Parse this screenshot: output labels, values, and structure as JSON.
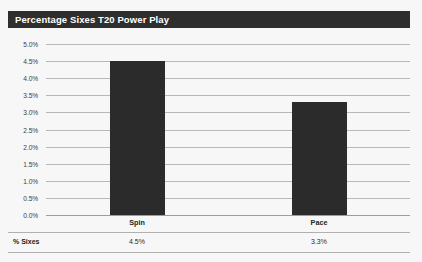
{
  "chart_data": {
    "type": "bar",
    "title": "Percentage Sixes T20 Power Play",
    "categories": [
      "Spin",
      "Pace"
    ],
    "values": [
      4.5,
      3.3
    ],
    "value_labels": [
      "4.5%",
      "3.3%"
    ],
    "series": [
      {
        "name": "% Sixes",
        "values": [
          4.5,
          3.3
        ]
      }
    ],
    "xlabel": "",
    "ylabel": "",
    "ylim": [
      0.0,
      5.0
    ],
    "ytick_labels": [
      "0.0%",
      "0.5%",
      "1.0%",
      "1.5%",
      "2.0%",
      "2.5%",
      "3.0%",
      "3.5%",
      "4.0%",
      "4.5%",
      "5.0%"
    ],
    "ytick_values": [
      0.0,
      0.5,
      1.0,
      1.5,
      2.0,
      2.5,
      3.0,
      3.5,
      4.0,
      4.5,
      5.0
    ],
    "grid": true,
    "legend": false,
    "data_table_visible": true,
    "bar_color": "#2b2b2b",
    "title_bar_color": "#2e2e2e",
    "title_text_color": "#ffffff",
    "gridline_color": "#b8b8b8",
    "plot_background": "#f7f7f7"
  },
  "data_table": {
    "row_label": "% Sixes",
    "cells": [
      "4.5%",
      "3.3%"
    ]
  }
}
